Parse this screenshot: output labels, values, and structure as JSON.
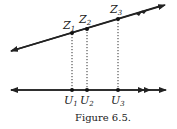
{
  "figure": {
    "caption": "Figure 6.5.",
    "top_line": {
      "points": [
        {
          "label": "Z",
          "sub": "1"
        },
        {
          "label": "Z",
          "sub": "2"
        },
        {
          "label": "Z",
          "sub": "3"
        }
      ]
    },
    "bottom_line": {
      "points": [
        {
          "label": "U",
          "sub": "1"
        },
        {
          "label": "U",
          "sub": "2"
        },
        {
          "label": "U",
          "sub": "3"
        }
      ]
    }
  }
}
